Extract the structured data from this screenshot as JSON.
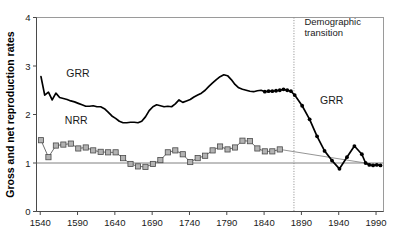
{
  "chart_data": {
    "type": "line",
    "title": "",
    "xlabel": "",
    "ylabel": "Gross and net reproduction rates",
    "xlim": [
      1535,
      2000
    ],
    "ylim": [
      0,
      4
    ],
    "xticks": [
      1540,
      1590,
      1640,
      1690,
      1740,
      1790,
      1840,
      1890,
      1940,
      1990
    ],
    "yticks": [
      0,
      1,
      2,
      3,
      4
    ],
    "xtick_labels": [
      "1540",
      "1590",
      "1640",
      "1690",
      "1740",
      "1790",
      "1840",
      "1890",
      "1940",
      "1990"
    ],
    "ytick_labels": [
      "0",
      "1",
      "2",
      "3",
      "4"
    ],
    "grid": false,
    "legend_position": "inline-annotation",
    "reference_lines": [
      {
        "name": "replacement-level",
        "orientation": "horizontal",
        "value": 1,
        "style": "solid-gray"
      },
      {
        "name": "demographic-transition",
        "orientation": "vertical",
        "value": 1880,
        "style": "dotted",
        "label": "Demographic transition"
      }
    ],
    "annotations": [
      {
        "name": "grr-label-early",
        "text": "GRR",
        "x": 1575,
        "y": 2.78
      },
      {
        "name": "nrr-label-early",
        "text": "NRR",
        "x": 1573,
        "y": 1.8
      },
      {
        "name": "grr-label-late",
        "text": "GRR",
        "x": 1915,
        "y": 2.22
      },
      {
        "name": "transition-label",
        "text": "Demographic transition",
        "x": 1890,
        "y": 3.85
      }
    ],
    "series": [
      {
        "name": "GRR",
        "label": "Gross reproduction rate",
        "color": "#000000",
        "style": "line",
        "markers_from": 1841,
        "x": [
          1541,
          1546,
          1551,
          1556,
          1561,
          1566,
          1571,
          1576,
          1581,
          1586,
          1591,
          1596,
          1601,
          1606,
          1611,
          1616,
          1621,
          1626,
          1631,
          1636,
          1641,
          1646,
          1651,
          1656,
          1661,
          1666,
          1671,
          1676,
          1681,
          1686,
          1691,
          1696,
          1701,
          1706,
          1711,
          1716,
          1721,
          1726,
          1731,
          1736,
          1741,
          1746,
          1751,
          1756,
          1761,
          1766,
          1771,
          1776,
          1781,
          1786,
          1791,
          1796,
          1801,
          1806,
          1811,
          1816,
          1821,
          1826,
          1831,
          1836,
          1841,
          1846,
          1851,
          1856,
          1861,
          1866,
          1871,
          1876,
          1881,
          1891,
          1901,
          1911,
          1921,
          1931,
          1941,
          1951,
          1961,
          1971,
          1976,
          1981,
          1986,
          1991,
          1996
        ],
        "y": [
          2.78,
          2.4,
          2.46,
          2.3,
          2.44,
          2.35,
          2.33,
          2.31,
          2.28,
          2.26,
          2.23,
          2.2,
          2.17,
          2.17,
          2.18,
          2.16,
          2.16,
          2.12,
          2.05,
          1.97,
          1.92,
          1.86,
          1.83,
          1.83,
          1.84,
          1.84,
          1.83,
          1.86,
          1.95,
          2.08,
          2.16,
          2.2,
          2.18,
          2.16,
          2.17,
          2.16,
          2.22,
          2.3,
          2.25,
          2.28,
          2.31,
          2.36,
          2.4,
          2.44,
          2.5,
          2.58,
          2.65,
          2.72,
          2.78,
          2.82,
          2.8,
          2.72,
          2.62,
          2.55,
          2.52,
          2.5,
          2.48,
          2.47,
          2.49,
          2.5,
          2.47,
          2.48,
          2.48,
          2.49,
          2.5,
          2.52,
          2.5,
          2.48,
          2.4,
          2.18,
          1.9,
          1.55,
          1.25,
          1.05,
          0.88,
          1.12,
          1.35,
          1.18,
          1.0,
          0.96,
          0.95,
          0.96,
          0.95
        ]
      },
      {
        "name": "NRR",
        "label": "Net reproduction rate",
        "color": "#b3b3b3",
        "style": "line-with-square-markers",
        "x": [
          1541,
          1551,
          1561,
          1571,
          1581,
          1591,
          1601,
          1611,
          1621,
          1631,
          1641,
          1651,
          1661,
          1671,
          1681,
          1691,
          1701,
          1711,
          1721,
          1731,
          1741,
          1751,
          1761,
          1771,
          1781,
          1791,
          1801,
          1811,
          1821,
          1831,
          1841,
          1851,
          1861
        ],
        "y": [
          1.47,
          1.12,
          1.36,
          1.38,
          1.4,
          1.3,
          1.32,
          1.26,
          1.23,
          1.22,
          1.22,
          1.1,
          0.98,
          0.93,
          0.92,
          0.98,
          1.06,
          1.22,
          1.26,
          1.18,
          1.02,
          1.1,
          1.15,
          1.26,
          1.34,
          1.28,
          1.32,
          1.46,
          1.45,
          1.3,
          1.24,
          1.24,
          1.28
        ]
      },
      {
        "name": "NRR-projection",
        "label": "Net reproduction rate projected trend",
        "color": "#7a7a7a",
        "style": "thin-line",
        "x": [
          1861,
          1996
        ],
        "y": [
          1.28,
          0.95
        ]
      }
    ]
  }
}
